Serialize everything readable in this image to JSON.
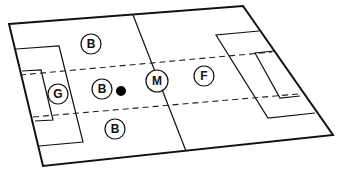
{
  "diagram": {
    "type": "soccer-field-positions",
    "colors": {
      "line": "#111111",
      "background": "#ffffff",
      "ball": "#000000"
    },
    "players": [
      {
        "id": "b-top",
        "label": "B",
        "x": 91,
        "y": 44
      },
      {
        "id": "g",
        "label": "G",
        "x": 58,
        "y": 94
      },
      {
        "id": "b-mid",
        "label": "B",
        "x": 102,
        "y": 89
      },
      {
        "id": "m",
        "label": "M",
        "x": 157,
        "y": 81
      },
      {
        "id": "f",
        "label": "F",
        "x": 204,
        "y": 76
      },
      {
        "id": "b-bottom",
        "label": "B",
        "x": 115,
        "y": 129
      }
    ],
    "ball": {
      "x": 121,
      "y": 91
    }
  }
}
